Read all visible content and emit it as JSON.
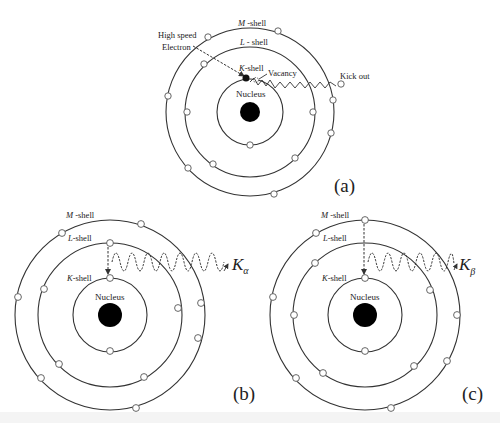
{
  "figure": {
    "background": "#ffffff",
    "line_color": "#333333",
    "nucleus_color": "#000000",
    "electron_fill": "#ffffff"
  },
  "panels": [
    {
      "id": "a",
      "label": "(a)",
      "center": [
        250,
        112
      ],
      "radii": {
        "nucleus": 10,
        "K": 33,
        "L": 65,
        "M": 84
      },
      "labels": {
        "m_shell_italic": "M",
        "m_shell_suffix": " -shell",
        "l_shell_italic": "L",
        "l_shell_suffix": " - shell",
        "k_shell_italic": "K",
        "k_shell_suffix": "-shell",
        "nucleus": "Nucleus",
        "high_speed_line1": "High speed",
        "high_speed_line2": "Electron",
        "vacancy": "Vacancy",
        "kick_out": "Kick out"
      }
    },
    {
      "id": "b",
      "label": "(b)",
      "center": [
        110,
        315
      ],
      "radii": {
        "nucleus": 12,
        "K": 37,
        "L": 72,
        "M": 95
      },
      "transition": "L to K",
      "labels": {
        "m_shell_italic": "M",
        "m_shell_suffix": " -shell",
        "l_shell_italic": "L",
        "l_shell_suffix": "-shell",
        "k_shell_italic": "K",
        "k_shell_suffix": "-shell",
        "nucleus": "Nucleus",
        "emission_main": "K",
        "emission_sub": "α"
      }
    },
    {
      "id": "c",
      "label": "(c)",
      "center": [
        365,
        315
      ],
      "radii": {
        "nucleus": 12,
        "K": 37,
        "L": 72,
        "M": 95
      },
      "transition": "M to K",
      "labels": {
        "m_shell_italic": "M",
        "m_shell_suffix": " -shell",
        "l_shell_italic": "L",
        "l_shell_suffix": "-shell",
        "k_shell_italic": "K",
        "k_shell_suffix": "-shell",
        "nucleus": "Nucleus",
        "emission_main": "K",
        "emission_sub": "β"
      }
    }
  ]
}
